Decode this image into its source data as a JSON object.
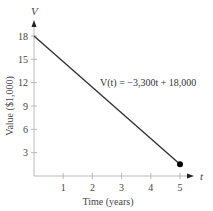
{
  "chart_data": {
    "type": "line",
    "title": "",
    "xlabel": "Time (years)",
    "ylabel": "Value ($1,000)",
    "x_axis_name": "t",
    "y_axis_name": "V",
    "xlim": [
      0,
      5
    ],
    "ylim": [
      0,
      18
    ],
    "x_ticks": [
      1,
      2,
      3,
      4,
      5
    ],
    "y_ticks": [
      3,
      6,
      9,
      12,
      15,
      18
    ],
    "grid": false,
    "series": [
      {
        "name": "V(t) = -3,300t + 18,000",
        "x": [
          0,
          5
        ],
        "y": [
          18,
          1.5
        ]
      }
    ],
    "endpoint_marker": {
      "x": 5,
      "y": 1.5
    },
    "annotations": [
      {
        "text": "V(t) = −3,300t + 18,000",
        "x": 2.3,
        "y": 12
      }
    ],
    "colors": {
      "line": "#333333",
      "axis": "#bbbbbb",
      "marker": "#000000"
    }
  }
}
